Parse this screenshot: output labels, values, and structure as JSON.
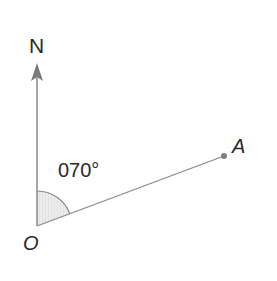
{
  "diagram": {
    "type": "bearing",
    "north_label": "N",
    "origin_label": "O",
    "point_label": "A",
    "bearing_label": "070°",
    "bearing_degrees": 70,
    "colors": {
      "line": "#8a8a8a",
      "text": "#2a2a2a",
      "angle_fill": "#e6e6e6",
      "point": "#808080"
    }
  }
}
